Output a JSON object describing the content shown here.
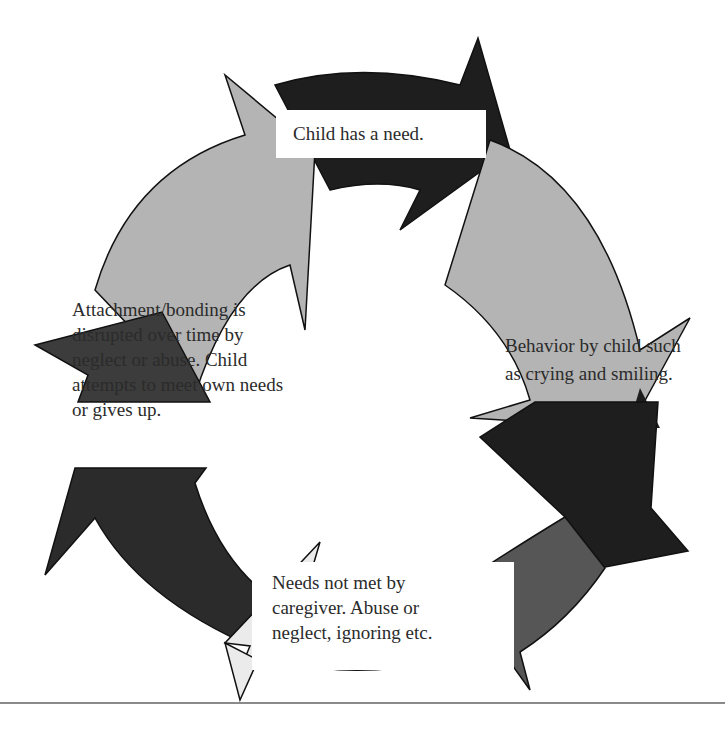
{
  "diagram": {
    "type": "cycle",
    "direction": "clockwise",
    "colors": {
      "light_gray": "#b4b4b4",
      "dark_gray": "#3c3c3c",
      "near_black": "#1e1e1e",
      "very_light_gray": "#ebebeb",
      "medium_gray": "#565656",
      "outline": "#111111",
      "background": "#ffffff",
      "rule": "#8a8a8a"
    },
    "steps": [
      {
        "id": "top",
        "text": "Child has a need."
      },
      {
        "id": "right",
        "text": "Behavior by child such as crying and smiling.",
        "lines": [
          "Behavior by child such",
          "as crying and smiling."
        ]
      },
      {
        "id": "bottom",
        "text": "Needs not met by caregiver. Abuse or neglect, ignoring etc.",
        "lines": [
          "Needs not met by",
          "caregiver. Abuse or",
          "neglect, ignoring etc."
        ]
      },
      {
        "id": "left",
        "text": "Attachment/bonding is disrupted over time by neglect or abuse. Child attempts to meet own needs or gives up.",
        "lines": [
          "Attachment/bonding is",
          "disrupted over time by",
          "neglect or abuse. Child",
          "attempts to meet own needs",
          "or gives up."
        ]
      }
    ]
  }
}
